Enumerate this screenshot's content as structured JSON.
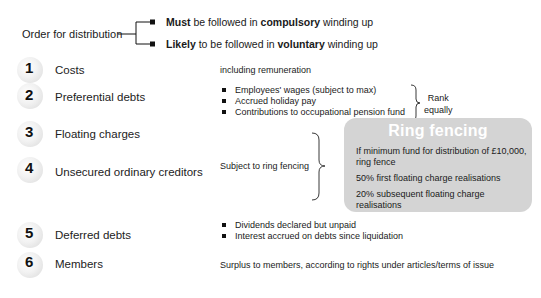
{
  "header": {
    "title": "Order for distribution",
    "branches": [
      {
        "bold": "Must",
        "text1": " be followed in ",
        "bold2": "compulsory",
        "text2": " winding up"
      },
      {
        "bold": "Likely",
        "text1": " to be followed in ",
        "bold2": "voluntary",
        "text2": " winding up"
      }
    ]
  },
  "steps": [
    {
      "number": "1",
      "label": "Costs",
      "note": "including remuneration"
    },
    {
      "number": "2",
      "label": "Preferential debts",
      "items": [
        "Employees' wages (subject to max)",
        "Accrued holiday pay",
        "Contributions to occupational pension fund"
      ],
      "bracket_note": [
        "Rank",
        "equally"
      ]
    },
    {
      "number": "3",
      "label": "Floating charges"
    },
    {
      "number": "4",
      "label": "Unsecured ordinary creditors"
    },
    {
      "number": "5",
      "label": "Deferred debts",
      "items": [
        "Dividends declared but unpaid",
        "Interest accrued on debts since liquidation"
      ]
    },
    {
      "number": "6",
      "label": "Members",
      "note": "Surplus to members, according to rights under articles/terms of issue"
    }
  ],
  "ring_fencing": {
    "bracket_note": "Subject to ring fencing",
    "title": "Ring fencing",
    "lines": [
      "If minimum fund for distribution of £10,000,",
      "ring fence",
      "50% first floating charge realisations",
      "20% subsequent floating charge realisations"
    ]
  },
  "colors": {
    "ring_box_bg": "#d4d4d4",
    "ring_title": "#ffffff",
    "text": "#1a1a1a"
  }
}
